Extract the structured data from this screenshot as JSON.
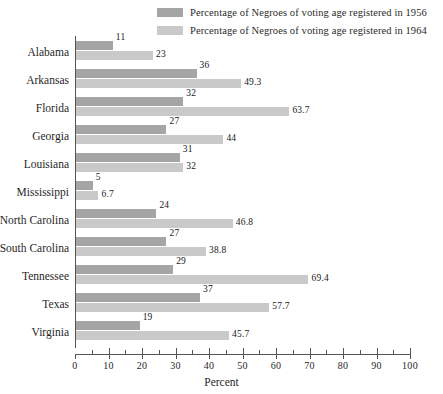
{
  "chart_data": {
    "type": "bar",
    "orientation": "horizontal",
    "title": "",
    "xlabel": "Percent",
    "ylabel": "",
    "xlim": [
      0,
      100
    ],
    "xticks": [
      0,
      10,
      20,
      30,
      40,
      50,
      60,
      70,
      80,
      90,
      100
    ],
    "minor_tick_step": 5,
    "grid": false,
    "legend_position": "top-right",
    "categories": [
      "Alabama",
      "Arkansas",
      "Florida",
      "Georgia",
      "Louisiana",
      "Mississippi",
      "North Carolina",
      "South Carolina",
      "Tennessee",
      "Texas",
      "Virginia"
    ],
    "series": [
      {
        "name": "Percentage of Negroes of voting age registered in 1956",
        "color": "#a5a5a5",
        "values": [
          11,
          36,
          32,
          27,
          31,
          5,
          24,
          27,
          29,
          37,
          19
        ],
        "labels": [
          "11",
          "36",
          "32",
          "27",
          "31",
          "5",
          "24",
          "27",
          "29",
          "37",
          "19"
        ]
      },
      {
        "name": "Percentage of Negroes of voting age registered in 1964",
        "color": "#c9c9c9",
        "values": [
          23,
          49.3,
          63.7,
          44,
          32,
          6.7,
          46.8,
          38.8,
          69.4,
          57.7,
          45.7
        ],
        "labels": [
          "23",
          "49.3",
          "63.7",
          "44",
          "32",
          "6.7",
          "46.8",
          "38.8",
          "69.4",
          "57.7",
          "45.7"
        ]
      }
    ]
  },
  "legend": {
    "items": [
      {
        "label": "Percentage of Negroes of voting age registered in 1956",
        "color": "#a5a5a5"
      },
      {
        "label": "Percentage of Negroes of voting age registered in 1964",
        "color": "#c9c9c9"
      }
    ]
  },
  "axis": {
    "x_label": "Percent"
  }
}
